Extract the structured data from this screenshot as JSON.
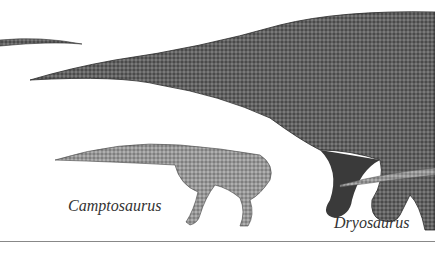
{
  "illustration": {
    "labels": {
      "camptosaurus": "Camptosaurus",
      "dryosaurus": "Dryosaurus"
    },
    "subjects": [
      "sauropod-tail",
      "sauropod-body",
      "camptosaurus",
      "dryosaurus-tail"
    ],
    "colors": {
      "ink": "#2a2a2a",
      "mid": "#6e6e6e",
      "light": "#a8a8a8",
      "background": "#ffffff",
      "rule": "#888888"
    }
  }
}
